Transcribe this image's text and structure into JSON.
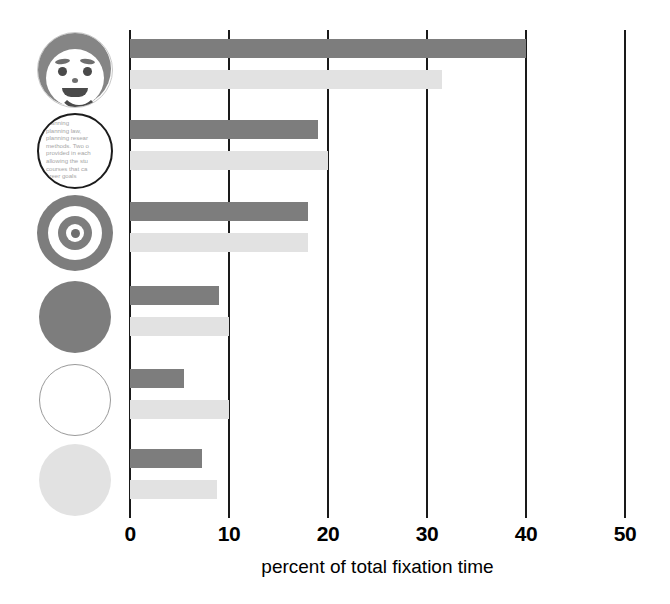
{
  "chart_data": {
    "type": "bar",
    "orientation": "horizontal",
    "title": "",
    "xlabel": "percent of total fixation time",
    "ylabel": "",
    "xlim": [
      0,
      50
    ],
    "xticks": [
      0,
      10,
      20,
      30,
      40,
      50
    ],
    "xtick_labels": [
      "0",
      "10",
      "20",
      "30",
      "40",
      "50"
    ],
    "grid": true,
    "legend": "none",
    "categories": [
      "face-icon",
      "text-circle-icon",
      "bullseye-icon",
      "solid-gray-circle-icon",
      "empty-circle-icon",
      "light-gray-circle-icon"
    ],
    "series": [
      {
        "name": "dark",
        "color": "#7d7d7d",
        "values": [
          40.0,
          19.0,
          18.0,
          9.0,
          5.5,
          7.3
        ]
      },
      {
        "name": "light",
        "color": "#e2e2e2",
        "values": [
          31.5,
          20.0,
          18.0,
          10.0,
          10.0,
          8.8
        ]
      }
    ]
  },
  "axis": {
    "label": "percent of total fixation time",
    "ticks": [
      {
        "value": 0,
        "label": "0"
      },
      {
        "value": 10,
        "label": "10"
      },
      {
        "value": 20,
        "label": "20"
      },
      {
        "value": 30,
        "label": "30"
      },
      {
        "value": 40,
        "label": "40"
      },
      {
        "value": 50,
        "label": "50"
      }
    ]
  },
  "icons": {
    "text_circle_lines": [
      "planning",
      "planning law,",
      "planning resear",
      "methods. Two o",
      "provided in each",
      "allowing the stu",
      "courses that ca",
      "areer goals"
    ]
  },
  "colors": {
    "series_dark": "#7d7d7d",
    "series_light": "#e2e2e2",
    "axis": "#1a1a1a",
    "background": "#ffffff"
  }
}
